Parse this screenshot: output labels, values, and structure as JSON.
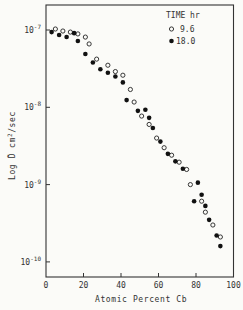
{
  "chart_data": {
    "type": "scatter",
    "title": "",
    "xlabel": "Atomic Percent Cb",
    "ylabel": "Log D̃  cm²/sec",
    "xlim": [
      0,
      100
    ],
    "ylim_log10": [
      -10.2,
      -6.68
    ],
    "yscale": "log",
    "grid": false,
    "legend_position": "upper right",
    "legend_title": "TIME hr",
    "x_ticks": [
      0,
      20,
      40,
      60,
      80,
      100
    ],
    "x_tick_labels": [
      "0",
      "20",
      "40",
      "60",
      "80",
      "100"
    ],
    "y_ticks": [
      1e-07,
      1e-08,
      1e-09,
      1e-10
    ],
    "y_tick_labels": [
      {
        "base": "10",
        "exp": "-7"
      },
      {
        "base": "10",
        "exp": "-8"
      },
      {
        "base": "10",
        "exp": "-9"
      },
      {
        "base": "10",
        "exp": "-10"
      }
    ],
    "series": [
      {
        "name": "9.6",
        "marker": "open-circle",
        "points": [
          [
            5,
            1.03e-07
          ],
          [
            9,
            9.7e-08
          ],
          [
            13,
            9.4e-08
          ],
          [
            17,
            8.9e-08
          ],
          [
            21,
            8.1e-08
          ],
          [
            23,
            6.6e-08
          ],
          [
            27,
            4.2e-08
          ],
          [
            33,
            3.5e-08
          ],
          [
            37,
            2.9e-08
          ],
          [
            41,
            2.6e-08
          ],
          [
            45,
            1.7e-08
          ],
          [
            47,
            1.17e-08
          ],
          [
            51,
            7.7e-09
          ],
          [
            55,
            6e-09
          ],
          [
            59,
            4e-09
          ],
          [
            63,
            3e-09
          ],
          [
            67,
            2.4e-09
          ],
          [
            71,
            1.95e-09
          ],
          [
            75,
            1.57e-09
          ],
          [
            77,
            1e-09
          ],
          [
            83,
            6.1e-10
          ],
          [
            85,
            4.4e-10
          ],
          [
            89,
            3e-10
          ],
          [
            93,
            2.1e-10
          ]
        ]
      },
      {
        "name": "18.0",
        "marker": "filled-circle",
        "points": [
          [
            3,
            9.4e-08
          ],
          [
            7,
            8.6e-08
          ],
          [
            11,
            8.1e-08
          ],
          [
            15,
            9.1e-08
          ],
          [
            17,
            7.2e-08
          ],
          [
            21,
            4.9e-08
          ],
          [
            25,
            3.8e-08
          ],
          [
            29,
            3.1e-08
          ],
          [
            33,
            2.8e-08
          ],
          [
            37,
            2.5e-08
          ],
          [
            41,
            2.1e-08
          ],
          [
            43,
            1.24e-08
          ],
          [
            49,
            9e-09
          ],
          [
            53,
            9.3e-09
          ],
          [
            55,
            7.3e-09
          ],
          [
            57,
            5.4e-09
          ],
          [
            61,
            3.6e-09
          ],
          [
            65,
            2.5e-09
          ],
          [
            69,
            2e-09
          ],
          [
            73,
            1.6e-09
          ],
          [
            79,
            6.1e-10
          ],
          [
            81,
            1.06e-09
          ],
          [
            83,
            7.4e-10
          ],
          [
            85,
            5.3e-10
          ],
          [
            87,
            3.5e-10
          ],
          [
            91,
            2.2e-10
          ],
          [
            93,
            1.6e-10
          ]
        ]
      }
    ]
  },
  "legend": {
    "title": "TIME hr",
    "items": [
      {
        "label": "9.6",
        "marker": "open-circle"
      },
      {
        "label": "18.0",
        "marker": "filled-circle"
      }
    ]
  },
  "axes": {
    "xlabel": "Atomic Percent Cb",
    "ylabel_prefix": "Log ",
    "ylabel_symbol": "D̃",
    "ylabel_units": "cm",
    "ylabel_units_exp": "2",
    "ylabel_units_suffix": "/sec"
  }
}
